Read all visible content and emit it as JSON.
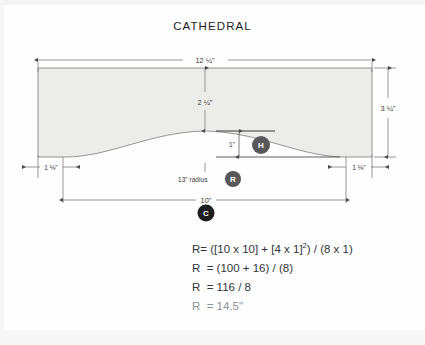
{
  "title": "CATHEDRAL",
  "drawing": {
    "type": "technical-drawing",
    "description": "Cathedral arch top panel elevation with dimensions",
    "shape": {
      "name": "cathedral-panel",
      "fill_color": "#ececea",
      "stroke_color": "#8a8a8a"
    },
    "dimensions": [
      {
        "id": "overall-width",
        "label": "12 ¼\"",
        "position": "top",
        "value": 12.25,
        "unit": "in"
      },
      {
        "id": "overall-height",
        "label": "3 ¼\"",
        "position": "right",
        "value": 3.25,
        "unit": "in"
      },
      {
        "id": "center-height",
        "label": "2 ¼\"",
        "position": "center-vertical",
        "value": 2.25,
        "unit": "in"
      },
      {
        "id": "rise",
        "label": "1\"",
        "position": "center-right",
        "value": 1,
        "unit": "in"
      },
      {
        "id": "left-shoulder",
        "label": "1 ⅛\"",
        "position": "bottom-left",
        "value": 1.125,
        "unit": "in"
      },
      {
        "id": "right-shoulder",
        "label": "1 ⅛\"",
        "position": "bottom-right",
        "value": 1.125,
        "unit": "in"
      },
      {
        "id": "chord",
        "label": "10\"",
        "position": "bottom-center",
        "value": 10,
        "unit": "in"
      },
      {
        "id": "radius-note",
        "label": "13\" radius",
        "position": "below-arch",
        "value": 13,
        "unit": "in"
      }
    ],
    "badges": [
      {
        "id": "badge-h",
        "letter": "H",
        "meaning": "height-of-arc",
        "color": "#58585a"
      },
      {
        "id": "badge-r",
        "letter": "R",
        "meaning": "radius",
        "color": "#58585a"
      },
      {
        "id": "badge-c",
        "letter": "C",
        "meaning": "chord",
        "color": "#1e1e1e"
      }
    ]
  },
  "formulas": [
    {
      "id": "formula-1",
      "lhs": "R",
      "rhs_pre": "= ([10 x 10] + [4 x 1]",
      "sup": "2",
      "rhs_post": ") / (8 x 1)"
    },
    {
      "id": "formula-2",
      "text": "R  = (100 + 16) / (8)"
    },
    {
      "id": "formula-3",
      "text": "R  = 116 / 8"
    },
    {
      "id": "formula-4",
      "text": "R  = 14.5\""
    }
  ],
  "colors": {
    "background": "#fefefe",
    "panel_fill": "#ececea",
    "line": "#8a8a8a",
    "dim_line": "#6d6d6d",
    "text": "#2a2a2a",
    "badge_grey": "#58585a",
    "badge_dark": "#1e1e1e"
  }
}
